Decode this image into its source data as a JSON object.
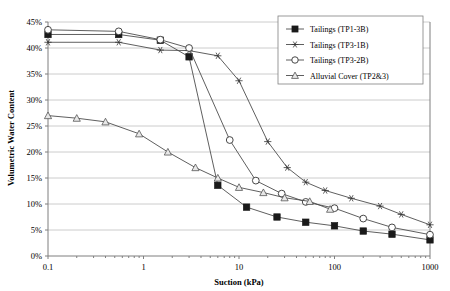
{
  "chart_data": {
    "type": "line",
    "title": "",
    "xlabel": "Suction (kPa)",
    "ylabel": "Volumetric Water Content",
    "xscale": "log",
    "xlim": [
      0.1,
      1000
    ],
    "ylim": [
      0,
      45
    ],
    "xticks": [
      0.1,
      1,
      10,
      100,
      1000
    ],
    "xtick_labels": [
      "0.1",
      "1",
      "10",
      "100",
      "1000"
    ],
    "yticks": [
      0,
      5,
      10,
      15,
      20,
      25,
      30,
      35,
      40,
      45
    ],
    "ytick_labels": [
      "0%",
      "5%",
      "10%",
      "15%",
      "20%",
      "25%",
      "30%",
      "35%",
      "40%",
      "45%"
    ],
    "grid": true,
    "legend_position": "top-right",
    "series": [
      {
        "name": "Tailings (TP1-3B)",
        "marker": "filled-square",
        "points": [
          [
            0.1,
            42.6
          ],
          [
            0.55,
            42.6
          ],
          [
            1.5,
            41.5
          ],
          [
            3.0,
            38.3
          ],
          [
            6.0,
            13.6
          ],
          [
            12.0,
            9.4
          ],
          [
            25.0,
            7.5
          ],
          [
            50.0,
            6.5
          ],
          [
            100.0,
            5.8
          ],
          [
            200.0,
            4.8
          ],
          [
            400.0,
            4.2
          ],
          [
            1000.0,
            3.1
          ]
        ]
      },
      {
        "name": "Tailings (TP3-1B)",
        "marker": "star",
        "points": [
          [
            0.1,
            41.1
          ],
          [
            0.55,
            41.1
          ],
          [
            1.5,
            39.6
          ],
          [
            3.0,
            39.5
          ],
          [
            6.0,
            38.5
          ],
          [
            10.0,
            33.7
          ],
          [
            20.0,
            22.0
          ],
          [
            32.0,
            17.0
          ],
          [
            50.0,
            14.2
          ],
          [
            80.0,
            12.6
          ],
          [
            150.0,
            11.1
          ],
          [
            300.0,
            9.6
          ],
          [
            500.0,
            8.0
          ],
          [
            1000.0,
            6.0
          ]
        ]
      },
      {
        "name": "Tailings (TP3-2B)",
        "marker": "open-circle",
        "points": [
          [
            0.1,
            43.5
          ],
          [
            0.55,
            43.2
          ],
          [
            1.5,
            41.6
          ],
          [
            3.0,
            40.0
          ],
          [
            8.0,
            22.3
          ],
          [
            15.0,
            14.5
          ],
          [
            28.0,
            12.0
          ],
          [
            50.0,
            10.4
          ],
          [
            100.0,
            9.2
          ],
          [
            200.0,
            7.2
          ],
          [
            400.0,
            5.5
          ],
          [
            1000.0,
            4.1
          ]
        ]
      },
      {
        "name": "Alluvial Cover (TP2&3)",
        "marker": "triangle",
        "points": [
          [
            0.1,
            27.0
          ],
          [
            0.2,
            26.5
          ],
          [
            0.4,
            25.8
          ],
          [
            0.9,
            23.5
          ],
          [
            1.8,
            20.0
          ],
          [
            3.5,
            17.0
          ],
          [
            6.0,
            15.0
          ],
          [
            10.0,
            13.2
          ],
          [
            18.0,
            12.2
          ],
          [
            30.0,
            11.2
          ],
          [
            55.0,
            10.5
          ],
          [
            90.0,
            9.0
          ]
        ]
      }
    ]
  }
}
